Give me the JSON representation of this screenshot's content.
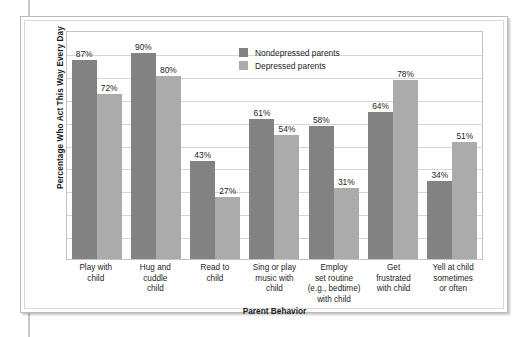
{
  "chart_data": {
    "type": "bar",
    "title": "",
    "xlabel": "Parent Behavior",
    "ylabel": "Percentage Who Act This Way Every Day",
    "ylim": [
      0,
      100
    ],
    "grid": true,
    "gridline_count": 10,
    "legend_position": "top-center",
    "categories": [
      "Play with child",
      "Hug and cuddle child",
      "Read to child",
      "Sing or play music with child",
      "Employ set routine (e.g., bedtime) with child",
      "Get frustrated with child",
      "Yell at child sometimes or often"
    ],
    "category_lines": [
      [
        "Play with",
        "child"
      ],
      [
        "Hug and",
        "cuddle",
        "child"
      ],
      [
        "Read to",
        "child"
      ],
      [
        "Sing or play",
        "music with",
        "child"
      ],
      [
        "Employ",
        "set routine",
        "(e.g., bedtime)",
        "with child"
      ],
      [
        "Get",
        "frustrated",
        "with child"
      ],
      [
        "Yell at child",
        "sometimes",
        "or often"
      ]
    ],
    "series": [
      {
        "name": "Nondepressed parents",
        "color": "#828282",
        "values": [
          87,
          90,
          43,
          61,
          58,
          64,
          34
        ],
        "labels": [
          "87%",
          "90%",
          "43%",
          "61%",
          "58%",
          "64%",
          "34%"
        ]
      },
      {
        "name": "Depressed parents",
        "color": "#ababab",
        "values": [
          72,
          80,
          27,
          54,
          31,
          78,
          51
        ],
        "labels": [
          "72%",
          "80%",
          "27%",
          "54%",
          "31%",
          "78%",
          "51%"
        ]
      }
    ]
  },
  "legend": {
    "items": [
      {
        "label": "Nondepressed parents",
        "color": "#828282"
      },
      {
        "label": "Depressed parents",
        "color": "#ababab"
      }
    ]
  }
}
